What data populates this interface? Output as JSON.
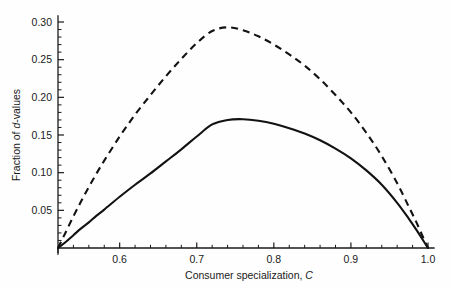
{
  "chart_data": {
    "type": "line",
    "title": "",
    "subtitle": "",
    "xlabel_text": "Consumer specialization, ",
    "xlabel_symbol": "C",
    "ylabel_text": "Fraction of ",
    "ylabel_symbol": "d",
    "ylabel_suffix": "-values",
    "xlim": [
      0.52,
      1.01
    ],
    "ylim": [
      0.0,
      0.315
    ],
    "grid": false,
    "legend": "none",
    "x_ticks": [
      0.6,
      0.7,
      0.8,
      0.9,
      1.0
    ],
    "x_tick_labels": [
      "0.6",
      "0.7",
      "0.8",
      "0.9",
      "1.0"
    ],
    "x_minor_step": 0.02,
    "y_ticks": [
      0.05,
      0.1,
      0.15,
      0.2,
      0.25,
      0.3
    ],
    "y_tick_labels": [
      "0.05",
      "0.10",
      "0.15",
      "0.20",
      "0.25",
      "0.30"
    ],
    "y_minor_step": 0.01,
    "series": [
      {
        "name": "dashed-curve",
        "style": "dashed",
        "color": "#121212",
        "peak_x": 0.72,
        "peak_y": 0.293,
        "x": [
          0.52,
          0.53,
          0.54,
          0.55,
          0.56,
          0.57,
          0.58,
          0.6,
          0.62,
          0.64,
          0.66,
          0.68,
          0.7,
          0.72,
          0.74,
          0.76,
          0.78,
          0.8,
          0.82,
          0.84,
          0.86,
          0.88,
          0.9,
          0.92,
          0.94,
          0.96,
          0.975,
          0.985,
          0.995,
          1.0
        ],
        "y": [
          0.0,
          0.021,
          0.042,
          0.062,
          0.081,
          0.099,
          0.116,
          0.148,
          0.177,
          0.203,
          0.228,
          0.251,
          0.272,
          0.288,
          0.293,
          0.289,
          0.281,
          0.27,
          0.257,
          0.242,
          0.224,
          0.203,
          0.18,
          0.153,
          0.122,
          0.086,
          0.055,
          0.034,
          0.011,
          0.0
        ]
      },
      {
        "name": "solid-curve",
        "style": "solid",
        "color": "#121212",
        "peak_x": 0.72,
        "peak_y": 0.171,
        "x": [
          0.52,
          0.53,
          0.54,
          0.55,
          0.56,
          0.57,
          0.58,
          0.6,
          0.62,
          0.64,
          0.66,
          0.68,
          0.7,
          0.72,
          0.74,
          0.76,
          0.78,
          0.8,
          0.82,
          0.84,
          0.86,
          0.88,
          0.9,
          0.92,
          0.94,
          0.96,
          0.975,
          0.985,
          0.995,
          1.0
        ],
        "y": [
          0.0,
          0.008,
          0.017,
          0.026,
          0.034,
          0.043,
          0.051,
          0.068,
          0.084,
          0.099,
          0.115,
          0.131,
          0.148,
          0.164,
          0.17,
          0.171,
          0.169,
          0.165,
          0.159,
          0.152,
          0.143,
          0.132,
          0.119,
          0.103,
          0.084,
          0.06,
          0.039,
          0.024,
          0.008,
          0.0
        ]
      }
    ]
  }
}
